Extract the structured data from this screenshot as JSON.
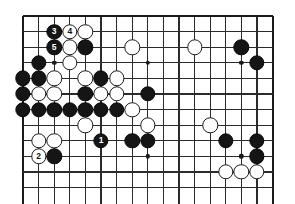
{
  "board": {
    "kind": "go-goban",
    "visible_columns": 17,
    "visible_rows": 12,
    "origin_x": 23,
    "origin_y": 16,
    "spacing": 15.6,
    "edges": {
      "top": true,
      "left": true,
      "right": true,
      "bottom": false
    },
    "line_color": "#2b2b2b",
    "edge_color": "#1a1a1a",
    "background_color": "#ffffff",
    "black_color": "#151515",
    "white_color": "#ffffff",
    "star_points": [
      {
        "col": 2,
        "row": 3
      },
      {
        "col": 8,
        "row": 3
      },
      {
        "col": 14,
        "row": 3
      },
      {
        "col": 2,
        "row": 9
      },
      {
        "col": 8,
        "row": 9
      },
      {
        "col": 14,
        "row": 9
      }
    ],
    "stones": [
      {
        "col": 2,
        "row": 1,
        "color": "black",
        "label": "3"
      },
      {
        "col": 3,
        "row": 1,
        "color": "white",
        "label": "4"
      },
      {
        "col": 4,
        "row": 1,
        "color": "white",
        "label": ""
      },
      {
        "col": 2,
        "row": 2,
        "color": "black",
        "label": "5"
      },
      {
        "col": 3,
        "row": 2,
        "color": "white",
        "label": ""
      },
      {
        "col": 4,
        "row": 2,
        "color": "black",
        "label": ""
      },
      {
        "col": 7,
        "row": 2,
        "color": "white",
        "label": ""
      },
      {
        "col": 11,
        "row": 2,
        "color": "white",
        "label": ""
      },
      {
        "col": 14,
        "row": 2,
        "color": "black",
        "label": ""
      },
      {
        "col": 1,
        "row": 3,
        "color": "black",
        "label": ""
      },
      {
        "col": 3,
        "row": 3,
        "color": "white",
        "label": ""
      },
      {
        "col": 15,
        "row": 3,
        "color": "black",
        "label": ""
      },
      {
        "col": 0,
        "row": 4,
        "color": "black",
        "label": ""
      },
      {
        "col": 1,
        "row": 4,
        "color": "black",
        "label": ""
      },
      {
        "col": 2,
        "row": 4,
        "color": "white",
        "label": ""
      },
      {
        "col": 4,
        "row": 4,
        "color": "white",
        "label": ""
      },
      {
        "col": 5,
        "row": 4,
        "color": "black",
        "label": ""
      },
      {
        "col": 6,
        "row": 4,
        "color": "white",
        "label": ""
      },
      {
        "col": 0,
        "row": 5,
        "color": "black",
        "label": ""
      },
      {
        "col": 1,
        "row": 5,
        "color": "white",
        "label": ""
      },
      {
        "col": 2,
        "row": 5,
        "color": "white",
        "label": ""
      },
      {
        "col": 4,
        "row": 5,
        "color": "black",
        "label": ""
      },
      {
        "col": 5,
        "row": 5,
        "color": "white",
        "label": ""
      },
      {
        "col": 6,
        "row": 5,
        "color": "white",
        "label": ""
      },
      {
        "col": 8,
        "row": 5,
        "color": "black",
        "label": ""
      },
      {
        "col": 0,
        "row": 6,
        "color": "black",
        "label": ""
      },
      {
        "col": 1,
        "row": 6,
        "color": "black",
        "label": ""
      },
      {
        "col": 2,
        "row": 6,
        "color": "black",
        "label": ""
      },
      {
        "col": 3,
        "row": 6,
        "color": "black",
        "label": ""
      },
      {
        "col": 4,
        "row": 6,
        "color": "black",
        "label": ""
      },
      {
        "col": 5,
        "row": 6,
        "color": "black",
        "label": ""
      },
      {
        "col": 6,
        "row": 6,
        "color": "black",
        "label": ""
      },
      {
        "col": 7,
        "row": 6,
        "color": "white",
        "label": ""
      },
      {
        "col": 4,
        "row": 7,
        "color": "white",
        "label": ""
      },
      {
        "col": 8,
        "row": 7,
        "color": "white",
        "label": ""
      },
      {
        "col": 12,
        "row": 7,
        "color": "white",
        "label": ""
      },
      {
        "col": 1,
        "row": 8,
        "color": "white",
        "label": ""
      },
      {
        "col": 2,
        "row": 8,
        "color": "white",
        "label": ""
      },
      {
        "col": 5,
        "row": 8,
        "color": "black",
        "label": "1"
      },
      {
        "col": 7,
        "row": 8,
        "color": "black",
        "label": ""
      },
      {
        "col": 8,
        "row": 8,
        "color": "black",
        "label": ""
      },
      {
        "col": 13,
        "row": 8,
        "color": "black",
        "label": ""
      },
      {
        "col": 15,
        "row": 8,
        "color": "black",
        "label": ""
      },
      {
        "col": 1,
        "row": 9,
        "color": "white",
        "label": "2"
      },
      {
        "col": 2,
        "row": 9,
        "color": "black",
        "label": ""
      },
      {
        "col": 15,
        "row": 9,
        "color": "black",
        "label": ""
      },
      {
        "col": 13,
        "row": 10,
        "color": "white",
        "label": ""
      },
      {
        "col": 14,
        "row": 10,
        "color": "white",
        "label": ""
      },
      {
        "col": 15,
        "row": 10,
        "color": "white",
        "label": ""
      }
    ]
  }
}
